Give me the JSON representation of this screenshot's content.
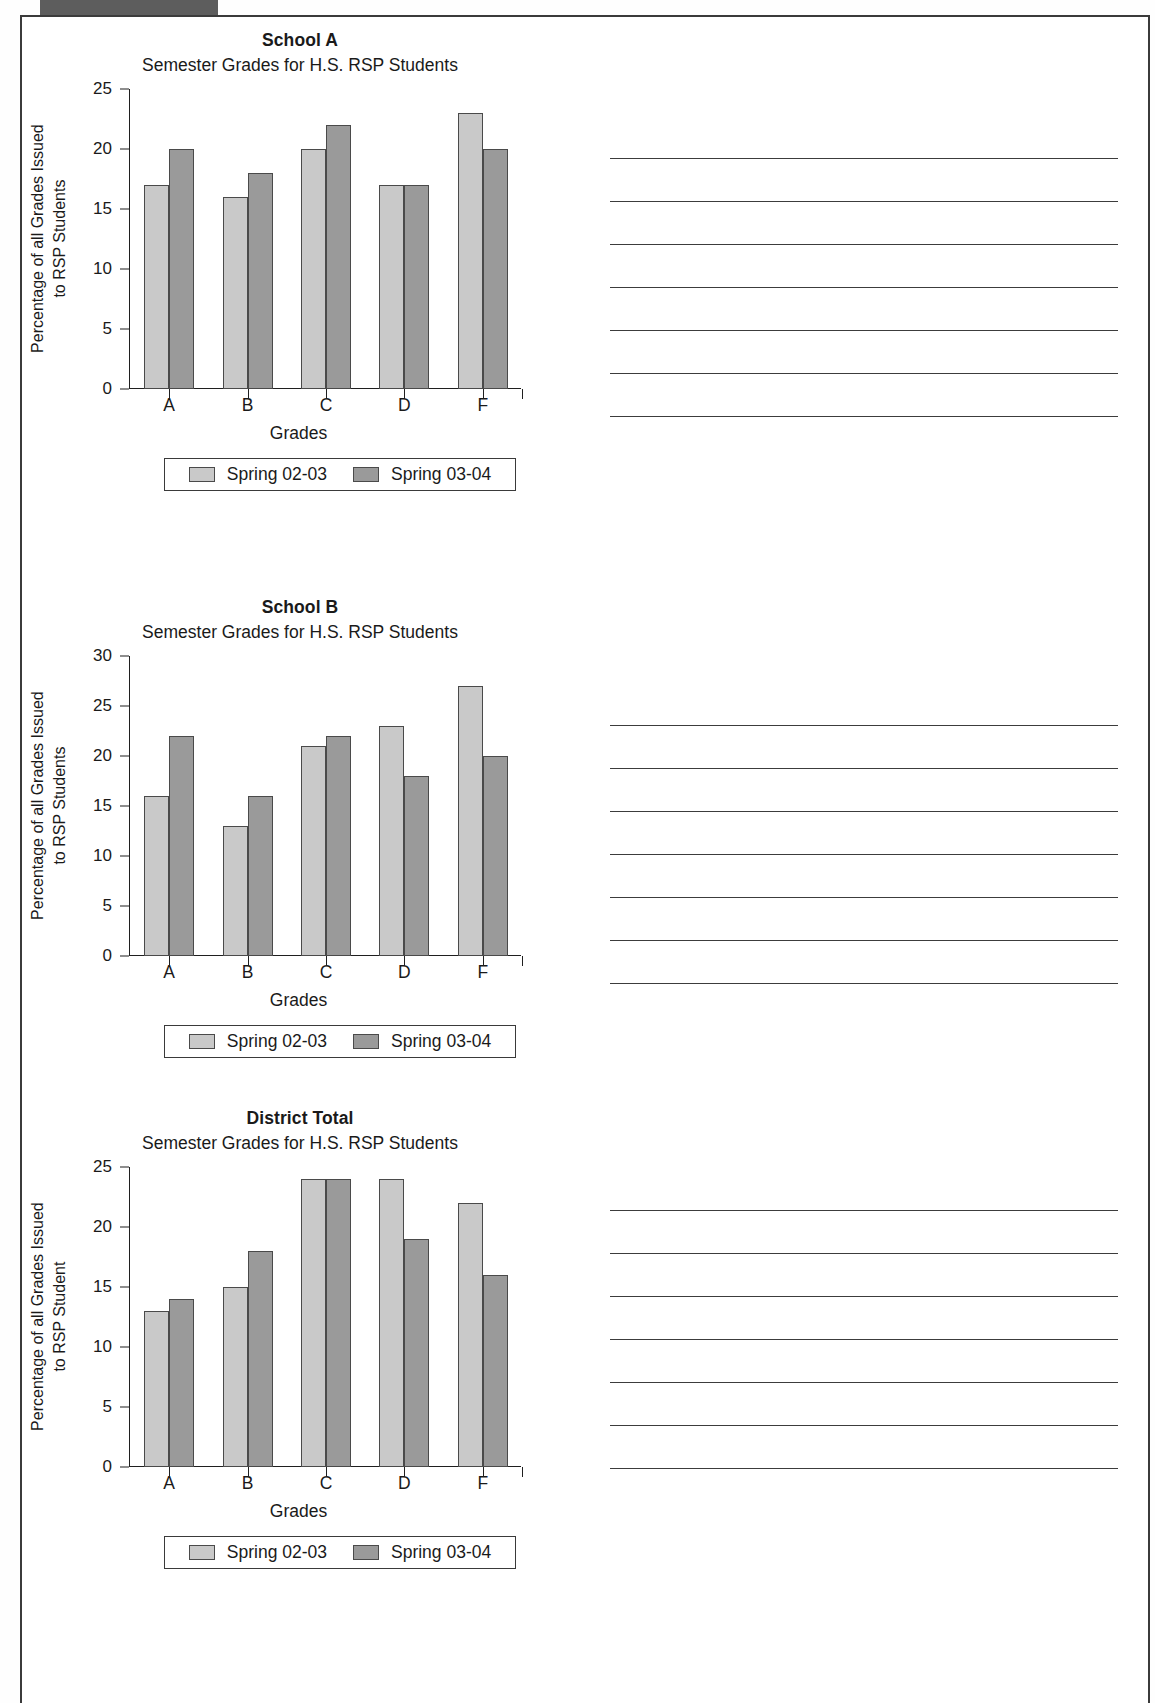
{
  "page": {
    "subtitle_common": "Semester Grades for H.S. RSP Students",
    "xlabel_common": "Grades",
    "legend": {
      "series1_label": "Spring 02-03",
      "series2_label": "Spring 03-04",
      "series1_color": "#c9c9c9",
      "series2_color": "#9a9a9a"
    }
  },
  "chart_data": [
    {
      "type": "bar",
      "title": "School A",
      "subtitle": "Semester Grades for H.S. RSP Students",
      "categories": [
        "A",
        "B",
        "C",
        "D",
        "F"
      ],
      "series": [
        {
          "name": "Spring 02-03",
          "values": [
            17,
            16,
            20,
            17,
            23
          ]
        },
        {
          "name": "Spring 03-04",
          "values": [
            20,
            18,
            22,
            17,
            20
          ]
        }
      ],
      "xlabel": "Grades",
      "ylabel": "Percentage of all Grades Issued to RSP Students",
      "ylabel_line1": "Percentage of all Grades Issued",
      "ylabel_line2": "to RSP Students",
      "ylim": [
        0,
        25
      ],
      "yticks": [
        0,
        5,
        10,
        15,
        20,
        25
      ],
      "grid": false,
      "legend_position": "below"
    },
    {
      "type": "bar",
      "title": "School B",
      "subtitle": "Semester Grades for H.S. RSP Students",
      "categories": [
        "A",
        "B",
        "C",
        "D",
        "F"
      ],
      "series": [
        {
          "name": "Spring 02-03",
          "values": [
            16,
            13,
            21,
            23,
            27
          ]
        },
        {
          "name": "Spring 03-04",
          "values": [
            22,
            16,
            22,
            18,
            20
          ]
        }
      ],
      "xlabel": "Grades",
      "ylabel": "Percentage of all Grades Issued to RSP Students",
      "ylabel_line1": "Percentage of all Grades Issued",
      "ylabel_line2": "to RSP Students",
      "ylim": [
        0,
        30
      ],
      "yticks": [
        0,
        5,
        10,
        15,
        20,
        25,
        30
      ],
      "grid": false,
      "legend_position": "below"
    },
    {
      "type": "bar",
      "title": "District Total",
      "subtitle": "Semester Grades for H.S. RSP Students",
      "categories": [
        "A",
        "B",
        "C",
        "D",
        "F"
      ],
      "series": [
        {
          "name": "Spring 02-03",
          "values": [
            13,
            15,
            24,
            24,
            22
          ]
        },
        {
          "name": "Spring 03-04",
          "values": [
            14,
            18,
            24,
            19,
            16
          ]
        }
      ],
      "xlabel": "Grades",
      "ylabel": "Percentage of all Grades Issued to RSP Student",
      "ylabel_line1": "Percentage of all Grades Issued",
      "ylabel_line2": "to RSP Student",
      "ylim": [
        0,
        25
      ],
      "yticks": [
        0,
        5,
        10,
        15,
        20,
        25
      ],
      "grid": false,
      "legend_position": "below"
    }
  ],
  "rule_groups": [
    {
      "top": 158,
      "count": 7,
      "spacing": 43
    },
    {
      "top": 725,
      "count": 7,
      "spacing": 43
    },
    {
      "top": 1210,
      "count": 7,
      "spacing": 43
    }
  ]
}
